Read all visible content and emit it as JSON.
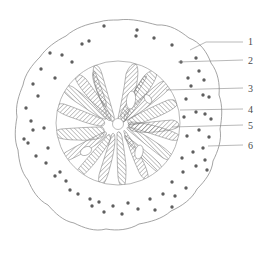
{
  "figure": {
    "kind": "botanical-cross-section-diagram",
    "title": "",
    "caption": "",
    "background_color": "#ffffff",
    "line_color": "#8d8d8d",
    "hatch_color": "#7b7b7b",
    "dot_color": "#5e5e5e",
    "label_color": "#4a4a4a"
  },
  "labels": [
    {
      "id": "1",
      "text": "1",
      "x": 248,
      "y": 45,
      "leader": "M 190 50 L 206 42 L 243 42"
    },
    {
      "id": "2",
      "text": "2",
      "x": 248,
      "y": 64,
      "leader": "M 178 62 L 243 60"
    },
    {
      "id": "3",
      "text": "3",
      "x": 248,
      "y": 92,
      "leader": "M 166 90 L 243 88"
    },
    {
      "id": "4",
      "text": "4",
      "x": 248,
      "y": 113,
      "leader": "M 180 110 L 243 109"
    },
    {
      "id": "5",
      "text": "5",
      "x": 248,
      "y": 129,
      "leader": "M 172 127 L 243 125"
    },
    {
      "id": "6",
      "text": "6",
      "x": 248,
      "y": 149,
      "leader": "M 208 146 L 243 145"
    }
  ],
  "regions": {
    "outer_boundary_name": "epidermis-outer-wall",
    "cortex_name": "cortex-with-scattered-cells",
    "inner_boundary_name": "endodermis-ring",
    "stele_name": "vascular-cylinder",
    "ray_name": "xylem-ray-wedge",
    "center_name": "pith-center"
  },
  "geometry": {
    "outer_center": [
      118,
      124
    ],
    "outer_radius": 104,
    "inner_center": [
      118,
      123
    ],
    "inner_radius": 62
  },
  "dots": [
    [
      104,
      26
    ],
    [
      137,
      30
    ],
    [
      82,
      44
    ],
    [
      89,
      41
    ],
    [
      154,
      38
    ],
    [
      136,
      36
    ],
    [
      172,
      45
    ],
    [
      50,
      53
    ],
    [
      62,
      55
    ],
    [
      72,
      62
    ],
    [
      181,
      62
    ],
    [
      196,
      58
    ],
    [
      199,
      71
    ],
    [
      41,
      69
    ],
    [
      55,
      78
    ],
    [
      33,
      84
    ],
    [
      188,
      78
    ],
    [
      204,
      80
    ],
    [
      191,
      86
    ],
    [
      38,
      96
    ],
    [
      26,
      108
    ],
    [
      203,
      95
    ],
    [
      186,
      99
    ],
    [
      209,
      97
    ],
    [
      31,
      121
    ],
    [
      44,
      128
    ],
    [
      196,
      112
    ],
    [
      205,
      114
    ],
    [
      184,
      117
    ],
    [
      211,
      119
    ],
    [
      24,
      139
    ],
    [
      28,
      143
    ],
    [
      199,
      130
    ],
    [
      187,
      136
    ],
    [
      209,
      137
    ],
    [
      36,
      156
    ],
    [
      46,
      163
    ],
    [
      203,
      148
    ],
    [
      193,
      152
    ],
    [
      182,
      158
    ],
    [
      55,
      176
    ],
    [
      66,
      181
    ],
    [
      196,
      166
    ],
    [
      183,
      172
    ],
    [
      207,
      170
    ],
    [
      78,
      194
    ],
    [
      90,
      199
    ],
    [
      99,
      202
    ],
    [
      172,
      182
    ],
    [
      186,
      188
    ],
    [
      113,
      206
    ],
    [
      128,
      203
    ],
    [
      150,
      199
    ],
    [
      163,
      194
    ],
    [
      175,
      196
    ],
    [
      122,
      214
    ],
    [
      138,
      209
    ],
    [
      104,
      212
    ],
    [
      92,
      206
    ],
    [
      70,
      190
    ],
    [
      60,
      172
    ],
    [
      48,
      148
    ],
    [
      33,
      130
    ],
    [
      205,
      160
    ],
    [
      172,
      207
    ],
    [
      155,
      210
    ]
  ],
  "rays": {
    "count": 18,
    "description": "radiating hatched xylem wedges"
  }
}
